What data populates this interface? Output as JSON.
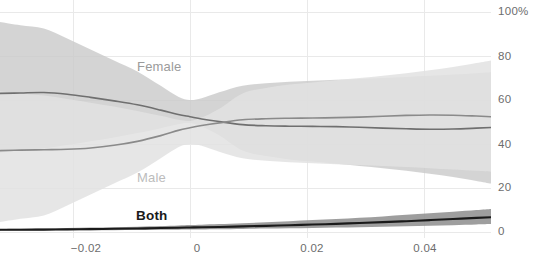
{
  "chart_data": {
    "type": "area",
    "title": "",
    "subtitle": "",
    "xlabel": "",
    "ylabel": "",
    "xlim": [
      -0.0325,
      0.0515
    ],
    "ylim": [
      0,
      100
    ],
    "grid": true,
    "legend_position": "inline-labels",
    "x_ticks": [
      {
        "value": -0.02,
        "label": "−0.02",
        "px": 86
      },
      {
        "value": 0,
        "label": "0",
        "px": 197
      },
      {
        "value": 0.02,
        "label": "0.02",
        "px": 312
      },
      {
        "value": 0.04,
        "label": "0.04",
        "px": 425
      }
    ],
    "y_ticks": [
      {
        "value": 100,
        "label": "100%",
        "px": 12
      },
      {
        "value": 80,
        "label": "80",
        "px": 57
      },
      {
        "value": 60,
        "label": "60",
        "px": 100
      },
      {
        "value": 40,
        "label": "40",
        "px": 145
      },
      {
        "value": 20,
        "label": "20",
        "px": 188
      },
      {
        "value": 0,
        "label": "0",
        "px": 232
      }
    ],
    "x": [
      -0.0325,
      -0.029,
      -0.025,
      -0.021,
      -0.017,
      -0.013,
      -0.009,
      -0.005,
      -0.002,
      0.0,
      0.002,
      0.005,
      0.009,
      0.013,
      0.017,
      0.021,
      0.025,
      0.029,
      0.033,
      0.037,
      0.041,
      0.045,
      0.049,
      0.0515
    ],
    "series": [
      {
        "name": "Female",
        "label": "Female",
        "color": "#c9c9c9",
        "line_color": "#6f6f6f",
        "values": [
          63.0,
          63.2,
          63.4,
          62.6,
          61.2,
          59.6,
          57.8,
          55.4,
          53.4,
          52.4,
          51.4,
          50.2,
          48.8,
          48.3,
          48.1,
          48.0,
          47.9,
          47.6,
          47.2,
          46.9,
          46.7,
          46.8,
          47.2,
          47.5
        ],
        "upper": [
          95.5,
          94.0,
          92.5,
          88.0,
          83.0,
          78.0,
          73.0,
          66.5,
          61.5,
          60.0,
          60.8,
          63.5,
          66.5,
          67.6,
          68.3,
          68.8,
          69.2,
          69.6,
          70.0,
          70.5,
          71.0,
          71.6,
          72.2,
          72.6
        ],
        "lower": [
          36.0,
          37.0,
          38.0,
          39.5,
          41.2,
          43.0,
          45.0,
          47.2,
          49.0,
          49.5,
          48.0,
          44.0,
          37.0,
          34.5,
          33.0,
          32.0,
          31.0,
          30.0,
          29.0,
          27.8,
          26.5,
          25.0,
          23.2,
          22.0
        ]
      },
      {
        "name": "Male",
        "label": "Male",
        "color": "#e2e2e2",
        "line_color": "#8a8a8a",
        "values": [
          37.0,
          37.2,
          37.4,
          37.6,
          38.2,
          39.4,
          41.2,
          43.8,
          46.2,
          47.4,
          48.4,
          49.6,
          51.0,
          51.5,
          51.7,
          51.8,
          52.0,
          52.2,
          52.6,
          53.0,
          53.2,
          53.1,
          52.7,
          52.4
        ],
        "upper": [
          64.0,
          63.0,
          62.0,
          60.5,
          58.8,
          57.0,
          55.0,
          52.8,
          51.0,
          50.5,
          52.0,
          56.0,
          63.0,
          65.5,
          67.0,
          68.0,
          69.0,
          70.0,
          71.0,
          72.2,
          73.5,
          75.0,
          76.8,
          78.0
        ],
        "lower": [
          4.5,
          6.0,
          7.5,
          12.0,
          17.0,
          22.0,
          27.0,
          33.5,
          38.5,
          40.0,
          39.2,
          36.5,
          33.5,
          32.4,
          31.7,
          31.2,
          30.8,
          30.4,
          30.0,
          29.5,
          29.0,
          28.4,
          27.8,
          27.4
        ]
      },
      {
        "name": "Both",
        "label": "Both",
        "color": "#8d8d8d",
        "line_color": "#1a1a1a",
        "values": [
          1.0,
          1.05,
          1.1,
          1.2,
          1.3,
          1.45,
          1.6,
          1.8,
          1.95,
          2.05,
          2.15,
          2.3,
          2.55,
          2.8,
          3.1,
          3.4,
          3.7,
          4.1,
          4.5,
          4.9,
          5.4,
          5.9,
          6.4,
          6.7
        ],
        "upper": [
          1.4,
          1.5,
          1.6,
          1.8,
          2.0,
          2.2,
          2.4,
          2.7,
          3.0,
          3.2,
          3.35,
          3.6,
          4.0,
          4.4,
          4.9,
          5.4,
          5.9,
          6.5,
          7.1,
          7.8,
          8.5,
          9.2,
          10.0,
          10.5
        ],
        "lower": [
          0.6,
          0.65,
          0.7,
          0.75,
          0.8,
          0.85,
          0.9,
          1.0,
          1.05,
          1.1,
          1.15,
          1.25,
          1.4,
          1.55,
          1.7,
          1.85,
          2.0,
          2.2,
          2.4,
          2.6,
          2.85,
          3.1,
          3.4,
          3.6
        ]
      }
    ]
  },
  "labels": {
    "female": "Female",
    "male": "Male",
    "both": "Both"
  }
}
